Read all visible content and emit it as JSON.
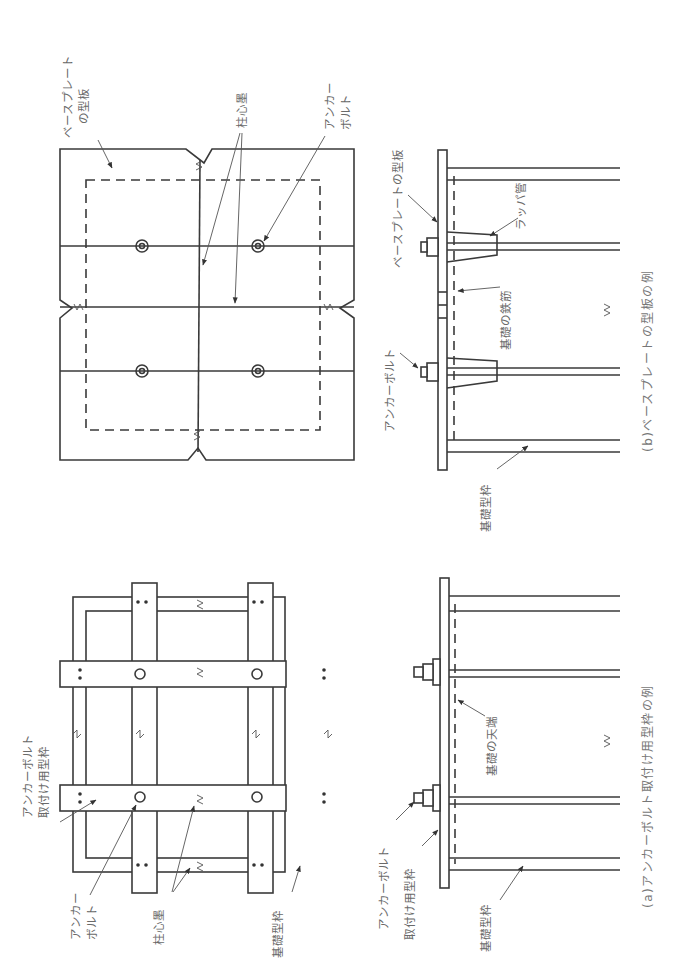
{
  "figure": {
    "orientation": "rotated 90° counter-clockwise",
    "panel_a": {
      "caption": "(a)アンカーボルト取付け用型枠の例",
      "labels": {
        "anchor_form_1": "アンカーボルト",
        "anchor_form_2": "取付け用型枠",
        "anchor_bolt_1": "アンカー",
        "anchor_bolt_2": "ボルト",
        "column_center": "柱心墨",
        "foundation_form": "基礎型枠",
        "sec_anchor_bolt": "アンカーボルト",
        "sec_mount_form": "取付け用型枠",
        "sec_foundation_form": "基礎型枠",
        "foundation_top": "基礎の天端"
      }
    },
    "panel_b": {
      "caption": "(b)ベースプレートの型板の例",
      "labels": {
        "template_1": "ベースプレート",
        "template_2": "の型板",
        "column_center": "柱心墨",
        "anchor_bolt_1": "アンカー",
        "anchor_bolt_2": "ボルト",
        "sec_template": "ベースプレートの型板",
        "trumpet_pipe": "ラッパ管",
        "rebar": "基礎の鉄筋",
        "sec_anchor_bolt": "アンカーボルト",
        "sec_foundation_form": "基礎型枠"
      }
    }
  }
}
